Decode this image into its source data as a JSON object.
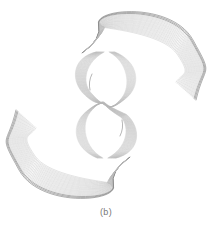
{
  "figure": {
    "caption": "(b)",
    "center": [
      106,
      105
    ],
    "line_count": 22,
    "colors": {
      "stroke_light": "#b8b8b8",
      "stroke_dark": "#6a6a6a",
      "background": "#ffffff",
      "caption": "#777777"
    },
    "lobes": [
      {
        "name": "top-right-lobe"
      },
      {
        "name": "bottom-left-lobe"
      }
    ],
    "bands": [
      {
        "name": "central-twisted-band"
      }
    ]
  }
}
